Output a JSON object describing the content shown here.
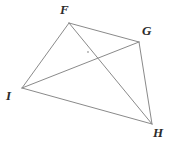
{
  "figure": {
    "name": "quadrilateral-fghi-with-diagonals",
    "type": "geometry-diagram",
    "background_color": "#ffffff",
    "stroke_color": "#8a8a8a",
    "stroke_width": 1,
    "label_color": "#2b2b2b",
    "width": 169,
    "height": 147
  },
  "vertices": [
    {
      "id": "F",
      "label": "F",
      "x": 69,
      "y": 23,
      "label_x": 60,
      "label_y": 3
    },
    {
      "id": "G",
      "label": "G",
      "x": 139,
      "y": 42,
      "label_x": 142,
      "label_y": 24
    },
    {
      "id": "I",
      "label": "I",
      "x": 22,
      "y": 88,
      "label_x": 6,
      "label_y": 89
    },
    {
      "id": "H",
      "label": "H",
      "x": 152,
      "y": 124,
      "label_x": 153,
      "label_y": 126
    }
  ],
  "edges": [
    {
      "id": "FG",
      "from": "F",
      "to": "G",
      "kind": "side",
      "x1": 69,
      "y1": 23,
      "x2": 139,
      "y2": 42
    },
    {
      "id": "GH",
      "from": "G",
      "to": "H",
      "kind": "side",
      "x1": 139,
      "y1": 42,
      "x2": 152,
      "y2": 124
    },
    {
      "id": "HI",
      "from": "H",
      "to": "I",
      "kind": "side",
      "x1": 152,
      "y1": 124,
      "x2": 22,
      "y2": 88
    },
    {
      "id": "IF",
      "from": "I",
      "to": "F",
      "kind": "side",
      "x1": 22,
      "y1": 88,
      "x2": 69,
      "y2": 23
    },
    {
      "id": "FH",
      "from": "F",
      "to": "H",
      "kind": "diagonal",
      "x1": 69,
      "y1": 23,
      "x2": 152,
      "y2": 124
    },
    {
      "id": "IG",
      "from": "I",
      "to": "G",
      "kind": "diagonal",
      "x1": 22,
      "y1": 88,
      "x2": 139,
      "y2": 42
    }
  ],
  "intersection": {
    "id": "diagonals-intersection",
    "x": 93,
    "y": 56,
    "marked": true,
    "mark_x": 88,
    "mark_y": 52
  }
}
